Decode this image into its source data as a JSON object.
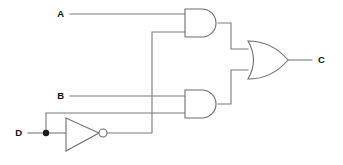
{
  "diagram": {
    "type": "logic-gate-schematic",
    "line_color": "#7a7a7a",
    "gate_stroke_color": "#6e6e6e",
    "gate_fill_color": "#ffffff",
    "label_color": "#111111",
    "background_color": "#ffffff"
  },
  "labels": {
    "input_a": "A",
    "input_b": "B",
    "input_d": "D",
    "output_c": "C"
  },
  "gates": [
    {
      "id": "and-gate-top",
      "type": "AND",
      "inputs": [
        "A",
        "NOT D"
      ],
      "output": "A AND (NOT D)"
    },
    {
      "id": "not-gate",
      "type": "NOT",
      "inputs": [
        "D"
      ],
      "output": "NOT D"
    },
    {
      "id": "and-gate-bottom",
      "type": "AND",
      "inputs": [
        "B",
        "D"
      ],
      "output": "B AND D"
    },
    {
      "id": "or-gate",
      "type": "OR",
      "inputs": [
        "A AND (NOT D)",
        "B AND D"
      ],
      "output": "C"
    }
  ],
  "expression": "C = (A AND NOT D) OR (B AND D)"
}
